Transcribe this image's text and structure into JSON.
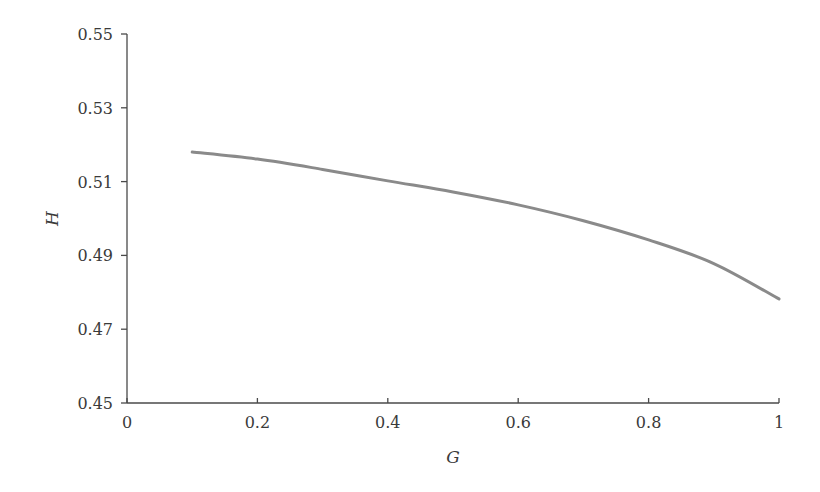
{
  "chart_data": {
    "type": "line",
    "title": "",
    "xlabel": "G",
    "ylabel": "H",
    "xlim": [
      0,
      1
    ],
    "ylim": [
      0.45,
      0.55
    ],
    "xticks": [
      0,
      0.2,
      0.4,
      0.6,
      0.8,
      1
    ],
    "xtick_labels": [
      "0",
      "0.2",
      "0.4",
      "0.6",
      "0.8",
      "1"
    ],
    "yticks": [
      0.45,
      0.47,
      0.49,
      0.51,
      0.53,
      0.55
    ],
    "ytick_labels": [
      "0.45",
      "0.47",
      "0.49",
      "0.51",
      "0.53",
      "0.55"
    ],
    "grid": false,
    "legend": null,
    "series": [
      {
        "name": "H(G)",
        "color": "#8a8a8a",
        "x": [
          0.1,
          0.2,
          0.3,
          0.4,
          0.5,
          0.6,
          0.7,
          0.8,
          0.9,
          1.0
        ],
        "y": [
          0.518,
          0.5161,
          0.5133,
          0.5102,
          0.5072,
          0.5037,
          0.4994,
          0.4942,
          0.4878,
          0.4782
        ]
      }
    ]
  },
  "layout": {
    "plot_left": 127,
    "plot_right": 779,
    "plot_top": 34,
    "plot_bottom": 403,
    "axis_color": "#4a4a4a",
    "text_color": "#3a3a3a"
  }
}
